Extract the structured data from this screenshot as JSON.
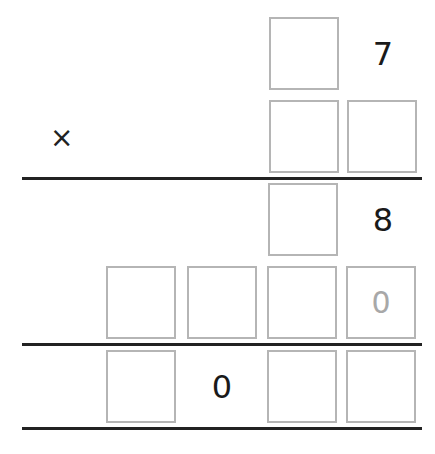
{
  "problem": {
    "operator": "×",
    "multiplicand": {
      "tens": "",
      "ones": "7"
    },
    "multiplier": {
      "tens": "",
      "ones": ""
    },
    "partial1": {
      "tens": "",
      "ones": "8"
    },
    "partial2": {
      "thousands": "",
      "hundreds": "",
      "tens": "",
      "ones_hint": "0"
    },
    "result": {
      "thousands": "",
      "hundreds": "0",
      "tens": "",
      "ones": ""
    }
  },
  "colors": {
    "box_border": "#b5b5b5",
    "line": "#222222",
    "hint_text": "#a8a8a8"
  }
}
